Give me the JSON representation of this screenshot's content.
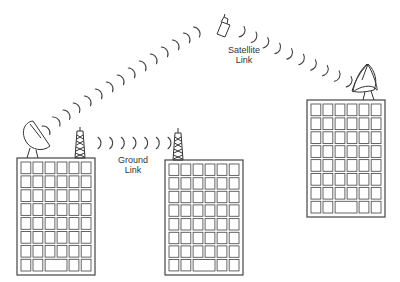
{
  "diagram": {
    "type": "network-links-illustration",
    "labels": {
      "satellite_link_line1": "Satellite",
      "satellite_link_line2": "Link",
      "ground_link_line1": "Ground",
      "ground_link_line2": "Link"
    },
    "buildings": [
      {
        "id": "left",
        "x": 17,
        "y": 158,
        "w": 78,
        "h": 117,
        "cols": 6,
        "rows": 8,
        "roof": "dish-and-tower"
      },
      {
        "id": "middle",
        "x": 165,
        "y": 160,
        "w": 78,
        "h": 115,
        "cols": 6,
        "rows": 8,
        "roof": "tower"
      },
      {
        "id": "right",
        "x": 307,
        "y": 100,
        "w": 78,
        "h": 117,
        "cols": 6,
        "rows": 8,
        "roof": "dish"
      }
    ],
    "links": [
      {
        "name": "satellite-uplink",
        "from": "left-dish",
        "to": "satellite",
        "waves": 14
      },
      {
        "name": "satellite-downlink",
        "from": "satellite",
        "to": "right-dish",
        "waves": 9
      },
      {
        "name": "ground-link",
        "from": "left-tower",
        "to": "middle-tower",
        "waves": 7
      }
    ],
    "colors": {
      "line": "#333333",
      "background": "#ffffff"
    }
  }
}
